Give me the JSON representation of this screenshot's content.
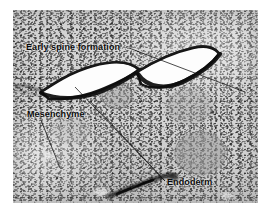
{
  "figure": {
    "kind": "histology-micrograph",
    "modality": "light microscopy, stained tissue section",
    "staining_appearance": "grayscale, dense dark stippled nuclei on pale matrix",
    "border_color": "#ffffff",
    "background_color": "#d3d3d3",
    "ink_color": "#0a0a0a"
  },
  "annotations": [
    {
      "id": "spine",
      "label": "Early spine formation",
      "target": "dark-outlined white lens-shaped epidermal placodes, upper centre",
      "leader_line": true
    },
    {
      "id": "mesenchyme",
      "label": "Mesenchyme",
      "target": "loose pale stippled connective tissue, lower left",
      "leader_line": true
    },
    {
      "id": "endoderm",
      "label": "Endoderm",
      "target": "dark elongated epithelial layer, lower centre",
      "leader_line": true
    }
  ],
  "features": {
    "spine_primordia": [
      {
        "id": "spine-left",
        "shape": "lens / crescent",
        "fill": "white",
        "outline": "dark basal layer"
      },
      {
        "id": "spine-right",
        "shape": "lens / crescent",
        "fill": "white",
        "outline": "dark basal layer"
      }
    ],
    "cell_clusters": [
      {
        "id": "cluster-upper-centre",
        "shape": "round",
        "tone": "slightly darker than matrix"
      },
      {
        "id": "cluster-right-large",
        "shape": "round",
        "tone": "darker stippled mass"
      },
      {
        "id": "cluster-right-upper",
        "shape": "round",
        "tone": "faint darker mass"
      }
    ],
    "endoderm_band": {
      "id": "endoderm-band",
      "shape": "elongated dark streak",
      "position": "lower centre"
    },
    "basal_line_left": {
      "id": "basal-line-left",
      "shape": "thin dark line running to left margin"
    }
  }
}
